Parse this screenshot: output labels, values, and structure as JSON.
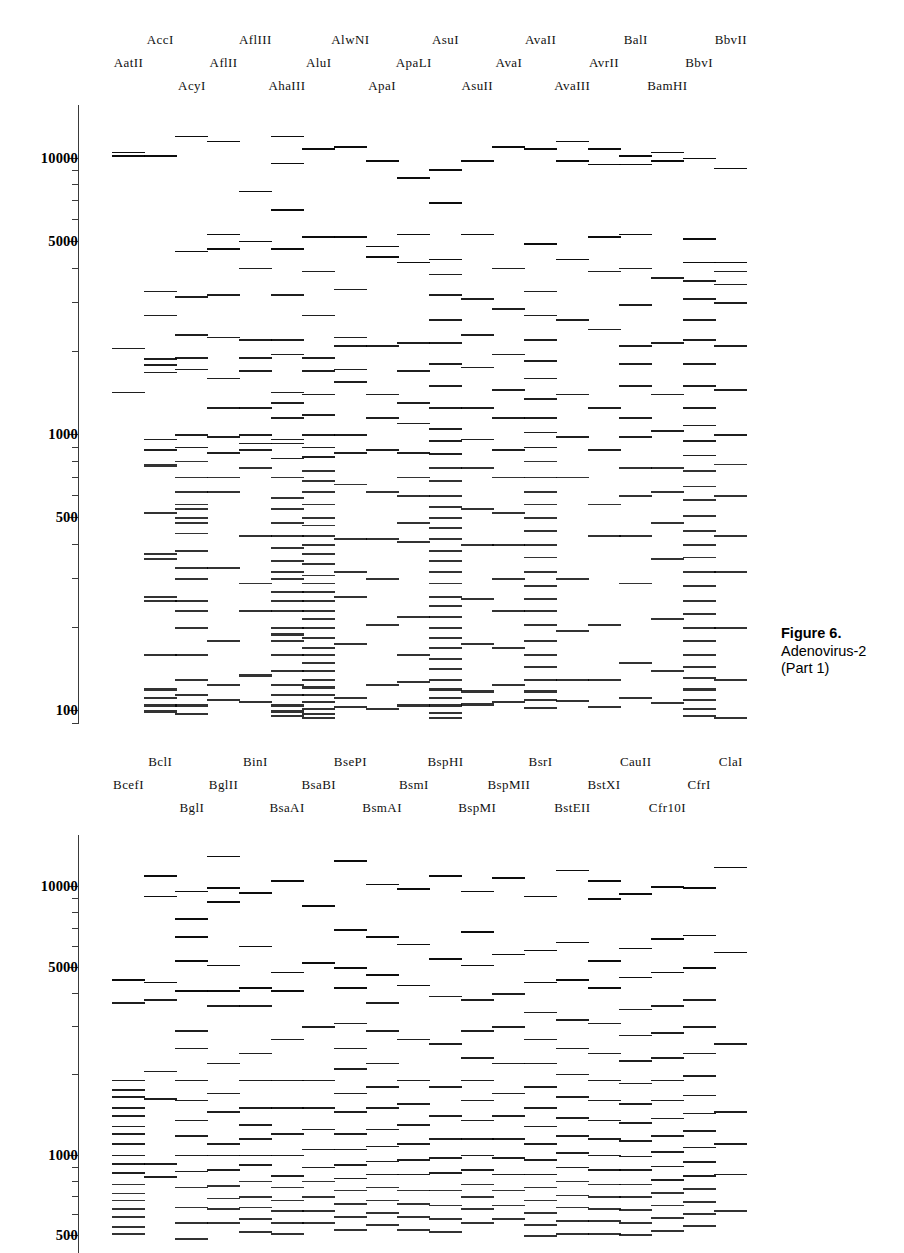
{
  "figure": {
    "caption_title": "Figure 6.",
    "caption_line2": "Adenovirus-2",
    "caption_line3": "(Part 1)"
  },
  "axis": {
    "unit": "bp",
    "scale": "log",
    "tick_labels": [
      "10000",
      "5000",
      "1000",
      "500",
      "100"
    ],
    "panel1_ticks": [
      10000,
      5000,
      1000,
      500,
      100
    ],
    "panel2_ticks": [
      10000,
      5000,
      1000,
      500
    ]
  },
  "panels": [
    {
      "id": "panel-1",
      "name": "adenovirus-2-part-1-upper-gel",
      "enzymes": [
        "AatII",
        "AccI",
        "AcyI",
        "AflII",
        "AflIII",
        "AhaIII",
        "AluI",
        "AlwNI",
        "ApaI",
        "ApaLI",
        "AsuI",
        "AsuII",
        "AvaI",
        "AvaII",
        "AvaIII",
        "AvrII",
        "BalI",
        "BamHI",
        "BbvI",
        "BbvII"
      ],
      "label_rows": {
        "row0": [
          "AccI",
          "AflIII",
          "AlwNI",
          "AsuI",
          "AvaII",
          "BalI",
          "BbvII"
        ],
        "row1": [
          "AatII",
          "AflII",
          "AluI",
          "ApaLI",
          "AvaI",
          "AvrII",
          "BbvI"
        ],
        "row2": [
          "AcyI",
          "AhaIII",
          "ApaI",
          "AsuII",
          "AvaIII",
          "BamHI"
        ]
      }
    },
    {
      "id": "panel-2",
      "name": "adenovirus-2-part-1-lower-gel",
      "enzymes": [
        "BcefI",
        "BclI",
        "BglI",
        "BglII",
        "BinI",
        "BsaAI",
        "BsaBI",
        "BsePI",
        "BsmAI",
        "BsmI",
        "BspHI",
        "BspMI",
        "BspMII",
        "BsrI",
        "BstEII",
        "BstXI",
        "CauII",
        "Cfr10I",
        "CfrI",
        "ClaI"
      ],
      "label_rows": {
        "row0": [
          "BclI",
          "BinI",
          "BsePI",
          "BspHI",
          "BsrI",
          "CauII",
          "ClaI"
        ],
        "row1": [
          "BcefI",
          "BglII",
          "BsaBI",
          "BsmI",
          "BspMII",
          "BstXI",
          "CfrI"
        ],
        "row2": [
          "BglI",
          "BsaAI",
          "BsmAI",
          "BspMI",
          "BstEII",
          "Cfr10I"
        ]
      }
    }
  ],
  "chart_data": {
    "type": "table",
    "ylabel": "Fragment size (bp)",
    "ylim": [
      90,
      16000
    ],
    "yscale": "log",
    "grid": false,
    "legend": "none",
    "panel1": {
      "lanes": [
        {
          "enzyme": "AatII",
          "fragments": [
            10500,
            10200,
            2050,
            1420
          ]
        },
        {
          "enzyme": "AccI",
          "fragments": [
            10200,
            3300,
            2700,
            1880,
            1790,
            1680,
            960,
            880,
            780,
            770,
            520,
            370,
            355,
            260,
            250,
            160,
            120,
            112,
            105,
            100
          ]
        },
        {
          "enzyme": "AcyI",
          "fragments": [
            12000,
            4600,
            3150,
            2300,
            1900,
            1720,
            1000,
            900,
            800,
            700,
            620,
            560,
            540,
            500,
            480,
            440,
            380,
            330,
            300,
            250,
            230,
            200,
            160,
            130,
            115,
            105,
            98
          ]
        },
        {
          "enzyme": "AflII",
          "fragments": [
            11500,
            5300,
            4700,
            3200,
            2250,
            1600,
            1250,
            980,
            860,
            700,
            620,
            330,
            180,
            125,
            110
          ]
        },
        {
          "enzyme": "AflIII",
          "fragments": [
            7600,
            5000,
            4000,
            2200,
            1900,
            1700,
            1250,
            1000,
            930,
            880,
            760,
            430,
            290,
            230,
            135,
            108
          ]
        },
        {
          "enzyme": "AhaIII",
          "fragments": [
            12000,
            9600,
            6500,
            4700,
            3200,
            2200,
            1950,
            1420,
            1300,
            1150,
            960,
            930,
            820,
            700,
            590,
            540,
            480,
            430,
            390,
            350,
            320,
            300,
            270,
            250,
            230,
            200,
            190,
            180,
            160,
            140,
            125,
            115,
            105,
            100,
            96
          ]
        },
        {
          "enzyme": "AluI",
          "fragments": [
            10800,
            5200,
            3900,
            2700,
            1900,
            1700,
            1400,
            1180,
            1000,
            900,
            830,
            740,
            680,
            620,
            560,
            500,
            470,
            430,
            400,
            370,
            340,
            310,
            290,
            270,
            250,
            230,
            215,
            200,
            185,
            170,
            160,
            150,
            140,
            130,
            122,
            115,
            108,
            102,
            98,
            95
          ]
        },
        {
          "enzyme": "AlwNI",
          "fragments": [
            11000,
            5200,
            3350,
            2250,
            2100,
            1720,
            1550,
            1000,
            860,
            660,
            420,
            320,
            260,
            175,
            112,
            104
          ]
        },
        {
          "enzyme": "ApaI",
          "fragments": [
            9800,
            4800,
            4400,
            2100,
            1400,
            1150,
            880,
            620,
            420,
            300,
            205,
            125,
            102
          ]
        },
        {
          "enzyme": "ApaLI",
          "fragments": [
            8500,
            5300,
            4200,
            2150,
            1700,
            1300,
            1100,
            860,
            700,
            600,
            480,
            410,
            220,
            160,
            128,
            105
          ]
        },
        {
          "enzyme": "AsuI",
          "fragments": [
            9100,
            6900,
            4300,
            3800,
            3200,
            2600,
            2150,
            1800,
            1500,
            1250,
            1050,
            950,
            850,
            760,
            680,
            600,
            550,
            500,
            460,
            420,
            380,
            350,
            320,
            290,
            260,
            240,
            220,
            200,
            185,
            170,
            155,
            142,
            130,
            120,
            112,
            105,
            99,
            95
          ]
        },
        {
          "enzyme": "AsuII",
          "fragments": [
            9800,
            5300,
            3100,
            2300,
            1750,
            1250,
            960,
            760,
            540,
            400,
            255,
            175,
            118,
            106
          ]
        },
        {
          "enzyme": "AvaI",
          "fragments": [
            11000,
            4000,
            2850,
            1950,
            1450,
            1150,
            880,
            700,
            520,
            400,
            300,
            230,
            170,
            125,
            108
          ]
        },
        {
          "enzyme": "AvaII",
          "fragments": [
            10800,
            4900,
            3300,
            2700,
            2200,
            1850,
            1600,
            1350,
            1150,
            1020,
            900,
            800,
            700,
            620,
            560,
            500,
            450,
            400,
            360,
            320,
            285,
            255,
            230,
            205,
            180,
            160,
            145,
            130,
            118,
            110,
            103
          ]
        },
        {
          "enzyme": "AvaIII",
          "fragments": [
            11500,
            9800,
            4300,
            2600,
            1400,
            980,
            700,
            300,
            195,
            130,
            109
          ]
        },
        {
          "enzyme": "AvrII",
          "fragments": [
            10800,
            9500,
            5200,
            3900,
            2400,
            1250,
            880,
            560,
            430,
            205,
            130,
            104
          ]
        },
        {
          "enzyme": "BalI",
          "fragments": [
            10200,
            9500,
            5300,
            4000,
            2950,
            2100,
            1800,
            1500,
            1150,
            980,
            760,
            600,
            430,
            290,
            150,
            112
          ]
        },
        {
          "enzyme": "BamHI",
          "fragments": [
            10500,
            9800,
            3700,
            2150,
            1400,
            1030,
            760,
            620,
            480,
            355,
            215,
            140,
            107
          ]
        },
        {
          "enzyme": "BbvI",
          "fragments": [
            10000,
            5100,
            4200,
            3600,
            3100,
            2600,
            2200,
            1800,
            1500,
            1250,
            1080,
            950,
            840,
            740,
            650,
            580,
            510,
            450,
            400,
            360,
            320,
            285,
            250,
            225,
            200,
            180,
            160,
            145,
            132,
            120,
            110,
            102,
            96
          ]
        },
        {
          "enzyme": "BbvII",
          "fragments": [
            9200,
            4200,
            3900,
            3500,
            3000,
            2100,
            1450,
            1000,
            780,
            600,
            430,
            320,
            200,
            130,
            95
          ]
        }
      ]
    },
    "panel2": {
      "lanes": [
        {
          "enzyme": "BcefI",
          "fragments": [
            4500,
            3700,
            1900,
            1750,
            1650,
            1500,
            1400,
            1280,
            1200,
            1100,
            1000,
            930,
            860,
            780,
            720,
            680,
            630,
            590,
            540,
            510
          ]
        },
        {
          "enzyme": "BclI",
          "fragments": [
            11000,
            9200,
            4400,
            3800,
            2050,
            1620,
            930,
            830
          ]
        },
        {
          "enzyme": "BglI",
          "fragments": [
            9600,
            7600,
            6500,
            5300,
            4100,
            2900,
            2500,
            1900,
            1600,
            1350,
            1180,
            1000,
            870,
            760,
            640,
            560,
            490
          ]
        },
        {
          "enzyme": "BglII",
          "fragments": [
            13000,
            9900,
            8800,
            5100,
            4100,
            3600,
            2200,
            1700,
            1450,
            1100,
            1000,
            880,
            770,
            690,
            630,
            560
          ]
        },
        {
          "enzyme": "BinI",
          "fragments": [
            9500,
            6000,
            4200,
            3600,
            2400,
            1900,
            1500,
            1300,
            1150,
            1000,
            920,
            800,
            700,
            640,
            580,
            520
          ]
        },
        {
          "enzyme": "BsaAI",
          "fragments": [
            10500,
            4800,
            4100,
            2700,
            1900,
            1500,
            1200,
            1000,
            840,
            760,
            680,
            620,
            560,
            510
          ]
        },
        {
          "enzyme": "BsaBI",
          "fragments": [
            8500,
            5200,
            3000,
            1900,
            1500,
            1250,
            1050,
            900,
            800,
            700,
            620,
            560
          ]
        },
        {
          "enzyme": "BsePI",
          "fragments": [
            12500,
            6900,
            5000,
            4200,
            3100,
            2500,
            2100,
            1700,
            1450,
            1200,
            1050,
            920,
            820,
            740,
            660,
            590,
            530
          ]
        },
        {
          "enzyme": "BsmAI",
          "fragments": [
            10200,
            6500,
            4700,
            3700,
            2900,
            2200,
            1800,
            1500,
            1250,
            1080,
            950,
            850,
            760,
            680,
            610,
            550
          ]
        },
        {
          "enzyme": "BsmI",
          "fragments": [
            9800,
            6100,
            4300,
            2700,
            1900,
            1550,
            1300,
            1100,
            960,
            850,
            740,
            660,
            590,
            530
          ]
        },
        {
          "enzyme": "BspHI",
          "fragments": [
            11000,
            5400,
            3900,
            2600,
            1800,
            1400,
            1150,
            980,
            860,
            740,
            650,
            580,
            520
          ]
        },
        {
          "enzyme": "BspMI",
          "fragments": [
            9600,
            6800,
            5100,
            3800,
            2900,
            2300,
            1900,
            1600,
            1350,
            1150,
            1000,
            880,
            780,
            700,
            630,
            560
          ]
        },
        {
          "enzyme": "BspMII",
          "fragments": [
            10800,
            5600,
            4000,
            3000,
            2200,
            1700,
            1400,
            1150,
            980,
            850,
            740,
            650,
            580
          ]
        },
        {
          "enzyme": "BsrI",
          "fragments": [
            9200,
            5800,
            4400,
            3400,
            2700,
            2200,
            1800,
            1500,
            1280,
            1100,
            960,
            850,
            760,
            680,
            610,
            550,
            500
          ]
        },
        {
          "enzyme": "BstEII",
          "fragments": [
            11500,
            6200,
            4500,
            3200,
            2500,
            2000,
            1650,
            1380,
            1180,
            1020,
            900,
            800,
            710,
            640,
            570,
            510
          ]
        },
        {
          "enzyme": "BstXI",
          "fragments": [
            10500,
            9000,
            5300,
            4200,
            3100,
            2400,
            1900,
            1600,
            1350,
            1150,
            1000,
            880,
            780,
            700,
            630,
            570,
            510
          ]
        },
        {
          "enzyme": "CauII",
          "fragments": [
            9400,
            5900,
            4600,
            3500,
            2800,
            2250,
            1850,
            1550,
            1320,
            1130,
            990,
            880,
            780,
            700,
            625,
            560,
            505
          ]
        },
        {
          "enzyme": "Cfr10I",
          "fragments": [
            10000,
            6400,
            4800,
            3600,
            2850,
            2300,
            1900,
            1600,
            1370,
            1180,
            1030,
            910,
            810,
            725,
            650,
            585,
            525
          ]
        },
        {
          "enzyme": "CfrI",
          "fragments": [
            9900,
            6600,
            5000,
            3800,
            3000,
            2400,
            1980,
            1670,
            1430,
            1230,
            1070,
            945,
            840,
            750,
            672,
            605,
            545
          ]
        },
        {
          "enzyme": "ClaI",
          "fragments": [
            11800,
            5700,
            2600,
            1450,
            1100,
            850,
            620
          ]
        }
      ]
    }
  }
}
